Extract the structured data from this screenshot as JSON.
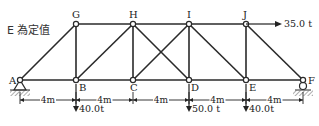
{
  "note": "E 為定值",
  "nodes": {
    "A": {
      "label": "A",
      "x": 20,
      "y": 80
    },
    "B": {
      "label": "B",
      "x": 76,
      "y": 80
    },
    "C": {
      "label": "C",
      "x": 133,
      "y": 80
    },
    "D": {
      "label": "D",
      "x": 189,
      "y": 80
    },
    "E": {
      "label": "E",
      "x": 246,
      "y": 80
    },
    "F": {
      "label": "F",
      "x": 303,
      "y": 80
    },
    "G": {
      "label": "G",
      "x": 76,
      "y": 24
    },
    "H": {
      "label": "H",
      "x": 133,
      "y": 24
    },
    "I": {
      "label": "I",
      "x": 189,
      "y": 24
    },
    "J": {
      "label": "J",
      "x": 246,
      "y": 24
    }
  },
  "members": [
    [
      "A",
      "B"
    ],
    [
      "B",
      "C"
    ],
    [
      "C",
      "D"
    ],
    [
      "D",
      "E"
    ],
    [
      "E",
      "F"
    ],
    [
      "G",
      "H"
    ],
    [
      "H",
      "I"
    ],
    [
      "I",
      "J"
    ],
    [
      "G",
      "B"
    ],
    [
      "H",
      "C"
    ],
    [
      "I",
      "D"
    ],
    [
      "J",
      "E"
    ],
    [
      "A",
      "G"
    ],
    [
      "B",
      "H"
    ],
    [
      "H",
      "D"
    ],
    [
      "C",
      "I"
    ],
    [
      "I",
      "E"
    ],
    [
      "J",
      "F"
    ]
  ],
  "dimensions": [
    "4m",
    "4m",
    "4m",
    "4m",
    "4m"
  ],
  "loads": {
    "B": "40.0t",
    "D": "50.0 t",
    "E": "40.0t",
    "J_horizontal": "35.0 t"
  },
  "supports": {
    "A": "pin",
    "F": "roller"
  },
  "colors": {
    "member": "#2a2a2a",
    "node_fill": "#ffffff",
    "ground_hatch": "#777777"
  }
}
